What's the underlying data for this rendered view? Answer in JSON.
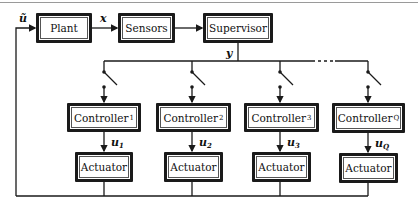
{
  "diagram": {
    "blocks": {
      "plant": "Plant",
      "sensors": "Sensors",
      "supervisor": "Supervisor"
    },
    "signals": {
      "plant_input": "ũ",
      "state": "x",
      "measurement": "y"
    },
    "controllers": [
      {
        "label": "Controller",
        "sub": "1",
        "signal": "u",
        "signal_sub": "1",
        "actuator": "Actuator"
      },
      {
        "label": "Controller",
        "sub": "2",
        "signal": "u",
        "signal_sub": "2",
        "actuator": "Actuator"
      },
      {
        "label": "Controller",
        "sub": "3",
        "signal": "u",
        "signal_sub": "3",
        "actuator": "Actuator"
      },
      {
        "label": "Controller",
        "sub": "Q",
        "signal": "u",
        "signal_sub": "Q",
        "actuator": "Actuator"
      }
    ],
    "bus_ellipsis": "· · ·",
    "colors": {
      "line": "#1a1a1a",
      "background": "#ffffff"
    }
  }
}
